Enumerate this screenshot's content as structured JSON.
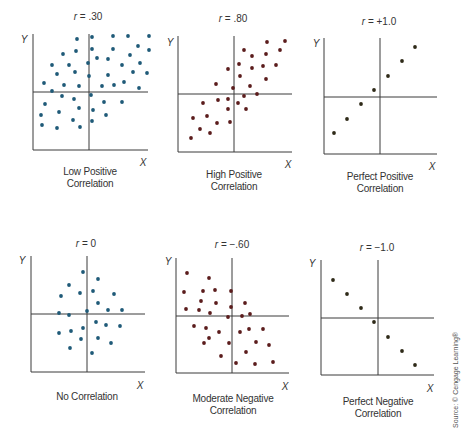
{
  "source_note": "Source: © Cengage Learning®",
  "chart_data": [
    {
      "type": "scatter",
      "title": "r = .30",
      "title_var": "r",
      "title_value": " = .30",
      "caption": [
        "Low Positive",
        "Correlation"
      ],
      "xlabel": "X",
      "ylabel": "Y",
      "correlation": 0.3,
      "dot_color": "#1f5a78",
      "axes": {
        "left": 33,
        "top": 34,
        "bottom": 150,
        "right": 148,
        "cross_x": 89,
        "cross_y": 92
      },
      "title_pos": [
        88,
        17
      ],
      "caption_pos": [
        90,
        166
      ],
      "xlabel_pos": [
        143,
        162
      ],
      "ylabel_pos": [
        24,
        39
      ],
      "points": [
        [
          77,
          39
        ],
        [
          92,
          37
        ],
        [
          113,
          36
        ],
        [
          128,
          36
        ],
        [
          149,
          36
        ],
        [
          76,
          51
        ],
        [
          92,
          49
        ],
        [
          113,
          49
        ],
        [
          138,
          46
        ],
        [
          149,
          50
        ],
        [
          63,
          54
        ],
        [
          97,
          58
        ],
        [
          108,
          59
        ],
        [
          130,
          55
        ],
        [
          140,
          63
        ],
        [
          52,
          65
        ],
        [
          69,
          65
        ],
        [
          88,
          63
        ],
        [
          122,
          65
        ],
        [
          57,
          74
        ],
        [
          75,
          72
        ],
        [
          89,
          76
        ],
        [
          108,
          75
        ],
        [
          133,
          72
        ],
        [
          147,
          73
        ],
        [
          44,
          83
        ],
        [
          64,
          85
        ],
        [
          79,
          86
        ],
        [
          102,
          86
        ],
        [
          114,
          85
        ],
        [
          124,
          82
        ],
        [
          139,
          88
        ],
        [
          52,
          91
        ],
        [
          91,
          95
        ],
        [
          62,
          96
        ],
        [
          74,
          99
        ],
        [
          104,
          102
        ],
        [
          122,
          102
        ],
        [
          45,
          104
        ],
        [
          79,
          108
        ],
        [
          93,
          110
        ],
        [
          59,
          112
        ],
        [
          41,
          115
        ],
        [
          106,
          115
        ],
        [
          73,
          120
        ],
        [
          42,
          125
        ],
        [
          57,
          128
        ],
        [
          80,
          127
        ],
        [
          92,
          121
        ]
      ]
    },
    {
      "type": "scatter",
      "title": "r = .80",
      "title_var": "r",
      "title_value": " = .80",
      "caption": [
        "High Positive",
        "Correlation"
      ],
      "xlabel": "X",
      "ylabel": "Y",
      "correlation": 0.8,
      "dot_color": "#5b1c1c",
      "axes": {
        "left": 178,
        "top": 36,
        "bottom": 152,
        "right": 292,
        "cross_x": 234,
        "cross_y": 94
      },
      "title_pos": [
        233,
        19
      ],
      "caption_pos": [
        234,
        169
      ],
      "xlabel_pos": [
        288,
        164
      ],
      "ylabel_pos": [
        170,
        42
      ],
      "points": [
        [
          267,
          42
        ],
        [
          285,
          41
        ],
        [
          244,
          50
        ],
        [
          252,
          56
        ],
        [
          266,
          54
        ],
        [
          280,
          50
        ],
        [
          239,
          64
        ],
        [
          228,
          69
        ],
        [
          252,
          68
        ],
        [
          263,
          66
        ],
        [
          276,
          65
        ],
        [
          240,
          76
        ],
        [
          266,
          79
        ],
        [
          216,
          84
        ],
        [
          233,
          88
        ],
        [
          250,
          86
        ],
        [
          257,
          94
        ],
        [
          244,
          96
        ],
        [
          203,
          103
        ],
        [
          218,
          100
        ],
        [
          228,
          99
        ],
        [
          238,
          103
        ],
        [
          228,
          109
        ],
        [
          246,
          109
        ],
        [
          193,
          118
        ],
        [
          207,
          116
        ],
        [
          200,
          129
        ],
        [
          217,
          123
        ],
        [
          230,
          122
        ],
        [
          210,
          133
        ],
        [
          191,
          138
        ]
      ]
    },
    {
      "type": "scatter",
      "title": "r = +1.0",
      "title_var": "r",
      "title_value": " = +1.0",
      "caption": [
        "Perfect Positive",
        "Correlation"
      ],
      "xlabel": "X",
      "ylabel": "Y",
      "correlation": 1.0,
      "dot_color": "#2e2a18",
      "axes": {
        "left": 324,
        "top": 38,
        "bottom": 154,
        "right": 437,
        "cross_x": 380,
        "cross_y": 97
      },
      "title_pos": [
        379,
        22
      ],
      "caption_pos": [
        380,
        171
      ],
      "xlabel_pos": [
        432,
        166
      ],
      "ylabel_pos": [
        316,
        43
      ],
      "points": [
        [
          415,
          47
        ],
        [
          402,
          61
        ],
        [
          388,
          76
        ],
        [
          374,
          90
        ],
        [
          361,
          104
        ],
        [
          347,
          119
        ],
        [
          334,
          133
        ]
      ]
    },
    {
      "type": "scatter",
      "title": "r = 0",
      "title_var": "r",
      "title_value": " = 0",
      "caption": [
        "No Correlation"
      ],
      "xlabel": "X",
      "ylabel": "Y",
      "correlation": 0.0,
      "dot_color": "#1f5a78",
      "axes": {
        "left": 31,
        "top": 256,
        "bottom": 372,
        "right": 145,
        "cross_x": 87,
        "cross_y": 314
      },
      "title_pos": [
        86,
        244
      ],
      "caption_pos": [
        87,
        391
      ],
      "xlabel_pos": [
        140,
        385
      ],
      "ylabel_pos": [
        22,
        260
      ],
      "points": [
        [
          83,
          272
        ],
        [
          98,
          279
        ],
        [
          69,
          285
        ],
        [
          61,
          296
        ],
        [
          80,
          293
        ],
        [
          93,
          291
        ],
        [
          114,
          294
        ],
        [
          98,
          303
        ],
        [
          108,
          310
        ],
        [
          122,
          310
        ],
        [
          59,
          313
        ],
        [
          69,
          315
        ],
        [
          87,
          311
        ],
        [
          96,
          322
        ],
        [
          106,
          325
        ],
        [
          120,
          326
        ],
        [
          83,
          328
        ],
        [
          71,
          331
        ],
        [
          59,
          333
        ],
        [
          81,
          339
        ],
        [
          98,
          338
        ],
        [
          111,
          343
        ],
        [
          70,
          348
        ],
        [
          92,
          353
        ]
      ]
    },
    {
      "type": "scatter",
      "title": "r = -.60",
      "title_var": "r",
      "title_value": " = −.60",
      "caption": [
        "Moderate Negative",
        "Correlation"
      ],
      "xlabel": "X",
      "ylabel": "Y",
      "correlation": -0.6,
      "dot_color": "#5b1c1c",
      "axes": {
        "left": 176,
        "top": 258,
        "bottom": 373,
        "right": 289,
        "cross_x": 232,
        "cross_y": 316
      },
      "title_pos": [
        232,
        245
      ],
      "caption_pos": [
        233,
        393
      ],
      "xlabel_pos": [
        285,
        386
      ],
      "ylabel_pos": [
        168,
        261
      ],
      "points": [
        [
          187,
          273
        ],
        [
          209,
          278
        ],
        [
          184,
          292
        ],
        [
          203,
          291
        ],
        [
          215,
          290
        ],
        [
          231,
          291
        ],
        [
          201,
          301
        ],
        [
          216,
          303
        ],
        [
          231,
          307
        ],
        [
          245,
          303
        ],
        [
          186,
          309
        ],
        [
          199,
          310
        ],
        [
          210,
          313
        ],
        [
          228,
          317
        ],
        [
          242,
          316
        ],
        [
          250,
          314
        ],
        [
          194,
          326
        ],
        [
          206,
          328
        ],
        [
          219,
          332
        ],
        [
          240,
          332
        ],
        [
          249,
          329
        ],
        [
          263,
          329
        ],
        [
          209,
          338
        ],
        [
          204,
          343
        ],
        [
          229,
          343
        ],
        [
          256,
          342
        ],
        [
          269,
          345
        ],
        [
          246,
          352
        ],
        [
          221,
          356
        ],
        [
          236,
          363
        ],
        [
          255,
          364
        ],
        [
          273,
          362
        ]
      ]
    },
    {
      "type": "scatter",
      "title": "r = -1.0",
      "title_var": "r",
      "title_value": " = −1.0",
      "caption": [
        "Perfect Negative",
        "Correlation"
      ],
      "xlabel": "X",
      "ylabel": "Y",
      "correlation": -1.0,
      "dot_color": "#2e2a18",
      "axes": {
        "left": 321,
        "top": 260,
        "bottom": 375,
        "right": 434,
        "cross_x": 378,
        "cross_y": 318
      },
      "title_pos": [
        377,
        248
      ],
      "caption_pos": [
        378,
        396
      ],
      "xlabel_pos": [
        430,
        388
      ],
      "ylabel_pos": [
        312,
        263
      ],
      "points": [
        [
          333,
          280
        ],
        [
          347,
          294
        ],
        [
          361,
          308
        ],
        [
          374,
          322
        ],
        [
          388,
          337
        ],
        [
          402,
          351
        ],
        [
          415,
          365
        ]
      ]
    }
  ]
}
